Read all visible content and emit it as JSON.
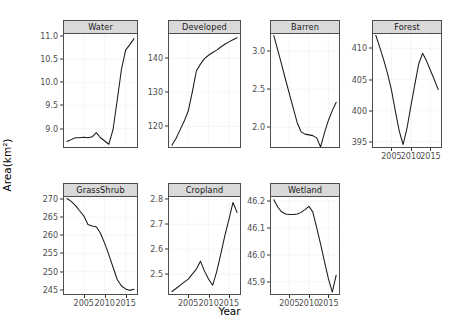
{
  "chart_data": {
    "type": "line",
    "title": "",
    "xlabel": "Year",
    "ylabel": "Area(km²)",
    "grid": true,
    "legend": "none",
    "facet_layout": {
      "rows": 2,
      "cols": 4,
      "note": "Forest occupies row 1 col 4; row 2 col 4 empty"
    },
    "x": [
      2001,
      2002,
      2003,
      2004,
      2005,
      2006,
      2007,
      2008,
      2009,
      2010,
      2011,
      2012,
      2013,
      2014,
      2015,
      2016,
      2017
    ],
    "xticks": [
      2005,
      2010,
      2015
    ],
    "xticklabels": [
      "2005",
      "2010",
      "2015"
    ],
    "panels": [
      {
        "name": "Water",
        "ylim": [
          8.6,
          11.05
        ],
        "yticks": [
          9.0,
          9.5,
          10.0,
          10.5,
          11.0
        ],
        "yticklabels": [
          "9.0",
          "9.5",
          "10.0",
          "10.5",
          "11.0"
        ],
        "values": [
          8.72,
          8.76,
          8.8,
          8.8,
          8.81,
          8.8,
          8.82,
          8.91,
          8.8,
          8.73,
          8.66,
          8.98,
          9.62,
          10.28,
          10.7,
          10.82,
          10.95
        ]
      },
      {
        "name": "Developed",
        "ylim": [
          114.0,
          147.0
        ],
        "yticks": [
          120,
          130,
          140
        ],
        "yticklabels": [
          "120",
          "130",
          "140"
        ],
        "values": [
          114.5,
          116.5,
          119.0,
          121.5,
          124.5,
          130.0,
          136.2,
          138.2,
          139.8,
          140.8,
          141.6,
          142.3,
          143.2,
          144.0,
          144.7,
          145.3,
          145.9
        ]
      },
      {
        "name": "Barren",
        "ylim": [
          1.74,
          3.23
        ],
        "yticks": [
          2.0,
          2.5,
          3.0
        ],
        "yticklabels": [
          "2.0",
          "2.5",
          "3.0"
        ],
        "values": [
          3.21,
          3.02,
          2.83,
          2.63,
          2.44,
          2.25,
          2.06,
          1.94,
          1.91,
          1.9,
          1.89,
          1.86,
          1.74,
          1.93,
          2.09,
          2.22,
          2.33
        ]
      },
      {
        "name": "Forest",
        "ylim": [
          394.2,
          412.3
        ],
        "yticks": [
          395,
          400,
          405,
          410
        ],
        "yticklabels": [
          "395",
          "400",
          "405",
          "410"
        ],
        "values": [
          412.1,
          410.2,
          408.2,
          406.0,
          403.4,
          400.0,
          396.8,
          394.6,
          397.2,
          400.8,
          404.2,
          407.5,
          409.2,
          408.0,
          406.5,
          405.0,
          403.4
        ]
      },
      {
        "name": "GrassShrub",
        "ylim": [
          243.8,
          270.6
        ],
        "yticks": [
          245,
          250,
          255,
          260,
          265,
          270
        ],
        "yticklabels": [
          "245",
          "250",
          "255",
          "260",
          "265",
          "270"
        ],
        "values": [
          270.2,
          269.4,
          268.3,
          266.8,
          265.4,
          263.0,
          262.6,
          262.4,
          260.6,
          257.8,
          254.6,
          251.2,
          247.8,
          246.0,
          245.2,
          244.8,
          245.1
        ]
      },
      {
        "name": "Cropland",
        "ylim": [
          2.42,
          2.81
        ],
        "yticks": [
          2.5,
          2.6,
          2.7,
          2.8
        ],
        "yticklabels": [
          "2.5",
          "2.6",
          "2.7",
          "2.8"
        ],
        "values": [
          2.43,
          2.442,
          2.455,
          2.468,
          2.48,
          2.5,
          2.52,
          2.552,
          2.512,
          2.48,
          2.455,
          2.51,
          2.58,
          2.655,
          2.72,
          2.788,
          2.748
        ]
      },
      {
        "name": "Wetland",
        "ylim": [
          45.855,
          46.215
        ],
        "yticks": [
          45.9,
          46.0,
          46.1,
          46.2
        ],
        "yticklabels": [
          "45.9",
          "46.0",
          "46.1",
          "46.2"
        ],
        "values": [
          46.205,
          46.178,
          46.16,
          46.152,
          46.15,
          46.15,
          46.152,
          46.158,
          46.168,
          46.18,
          46.16,
          46.1,
          46.04,
          45.975,
          45.912,
          45.862,
          45.925
        ]
      }
    ]
  }
}
